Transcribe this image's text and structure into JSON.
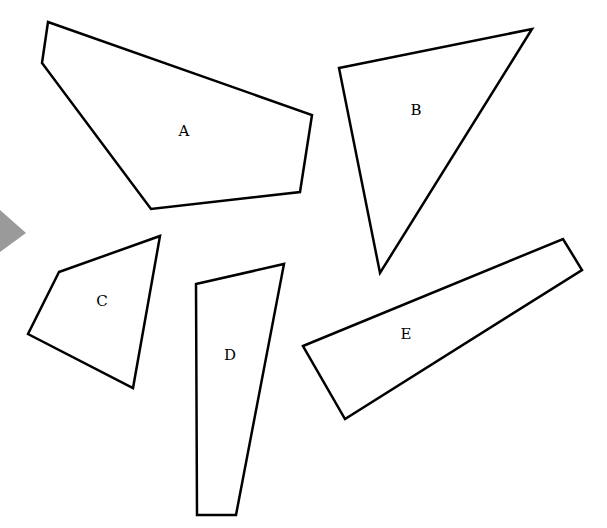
{
  "diagram": {
    "shapes": [
      {
        "id": "A",
        "label": "A",
        "points": "48,22 312,115 300,192 151,209 42,63",
        "label_x": 184,
        "label_y": 132
      },
      {
        "id": "B",
        "label": "B",
        "points": "339,68 532,29 380,273",
        "label_x": 416,
        "label_y": 111
      },
      {
        "id": "C",
        "label": "C",
        "points": "59,272 160,236 133,388 28,334",
        "label_x": 102,
        "label_y": 302
      },
      {
        "id": "D",
        "label": "D",
        "points": "196,284 284,264 236,515 197,515",
        "label_x": 230,
        "label_y": 356
      },
      {
        "id": "E",
        "label": "E",
        "points": "303,346 563,239 582,270 345,419",
        "label_x": 406,
        "label_y": 335
      }
    ],
    "pointer": {
      "points": "0,210 26,233 0,252",
      "color": "#9a9a9a"
    }
  }
}
